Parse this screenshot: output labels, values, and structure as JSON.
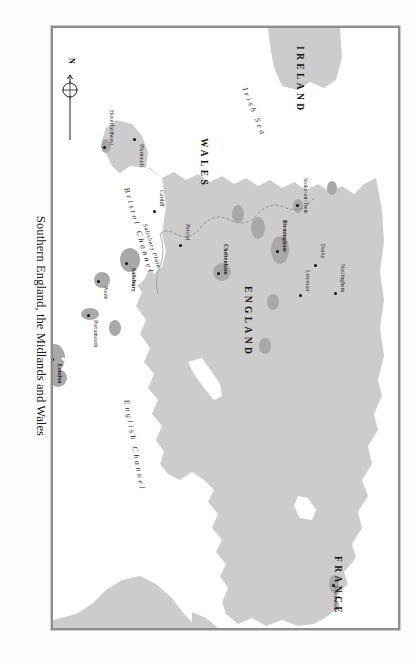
{
  "figure": {
    "caption": "Southern England, the Midlands and Wales",
    "orientation_deg": 90,
    "frame_color": "#8d8d8d",
    "land_color": "#cccccc",
    "urban_color": "#a9a9a9",
    "sea_color": "#ffffff"
  },
  "compass": {
    "north_label": "N",
    "name": "north-arrow"
  },
  "countries": [
    {
      "label": "IRELAND",
      "x": 35,
      "y": 100
    },
    {
      "label": "WALES",
      "x": 128,
      "y": 196
    },
    {
      "label": "ENGLAND",
      "x": 290,
      "y": 150
    },
    {
      "label": "FRANCE",
      "x": 543,
      "y": 62
    }
  ],
  "water_bodies": [
    {
      "label": "Irish Sea",
      "x": 86,
      "y": 155
    },
    {
      "label": "Bristol Channel",
      "x": 218,
      "y": 272
    },
    {
      "label": "English Channel",
      "x": 420,
      "y": 272
    }
  ],
  "regions": [
    {
      "label": "Salisbury Plain",
      "x": 372,
      "y": 206
    }
  ],
  "cities": [
    {
      "name": "Norwich",
      "x": 565,
      "y": 66,
      "bold": false,
      "anchor": "left"
    },
    {
      "name": "Stoke-on-Trent",
      "x": 193,
      "y": 95,
      "bold": false,
      "anchor": "left"
    },
    {
      "name": "Derby",
      "x": 243,
      "y": 78,
      "bold": false,
      "anchor": "left"
    },
    {
      "name": "Nottingham",
      "x": 268,
      "y": 57,
      "bold": false,
      "anchor": "left"
    },
    {
      "name": "Leicester",
      "x": 268,
      "y": 91,
      "bold": false,
      "anchor": "left"
    },
    {
      "name": "Birmingham",
      "x": 227,
      "y": 115,
      "bold": true,
      "anchor": "left"
    },
    {
      "name": "Cheltenham",
      "x": 251,
      "y": 170,
      "bold": true,
      "anchor": "left"
    },
    {
      "name": "Bristol",
      "x": 218,
      "y": 214,
      "bold": false,
      "anchor": "left"
    },
    {
      "name": "Cardiff",
      "x": 183,
      "y": 239,
      "bold": false,
      "anchor": "left"
    },
    {
      "name": "Haverfordwest",
      "x": 120,
      "y": 310,
      "bold": false,
      "anchor": "left"
    },
    {
      "name": "Salisbury",
      "x": 225,
      "y": 270,
      "bold": true,
      "anchor": "left"
    },
    {
      "name": "Poole",
      "x": 200,
      "y": 299,
      "bold": false,
      "anchor": "left"
    },
    {
      "name": "Portsmouth",
      "x": 237,
      "y": 330,
      "bold": false,
      "anchor": "left"
    },
    {
      "name": "London",
      "x": 320,
      "y": 345,
      "bold": true,
      "anchor": "left"
    },
    {
      "name": "Plymouth",
      "x": 111,
      "y": 390,
      "bold": false,
      "anchor": "left"
    }
  ]
}
